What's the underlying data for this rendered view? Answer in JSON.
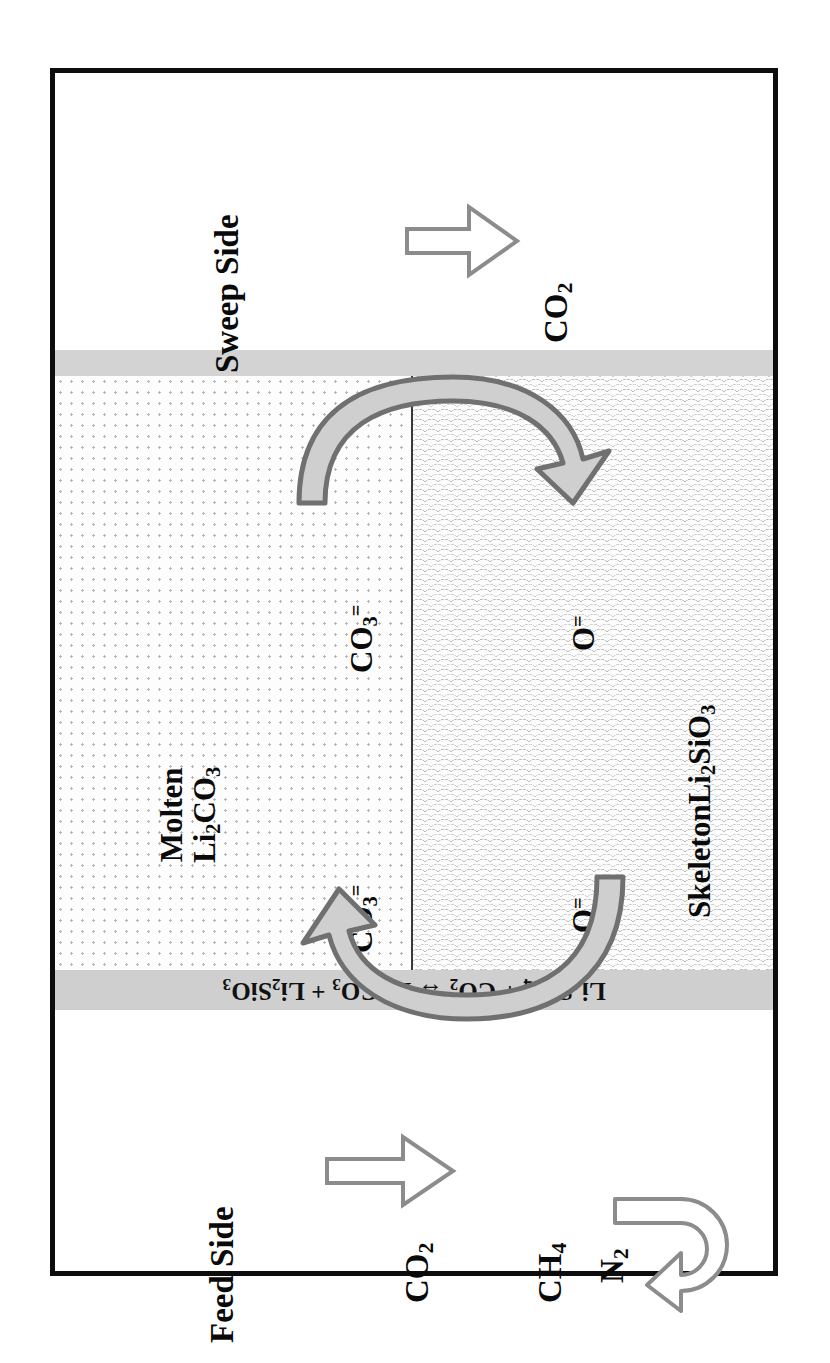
{
  "figure": {
    "type": "schematic-diagram",
    "orientation": "rotated-90-ccw"
  },
  "sweep_side": {
    "title": "Sweep Side",
    "gas_label": "CO",
    "gas_sub": "2",
    "arrow": "outward-permeate-arrow"
  },
  "feed_side": {
    "title": "Feed Side",
    "gas_label": "CO",
    "gas_sub": "2",
    "retentate": [
      {
        "label": "CH",
        "sub": "4"
      },
      {
        "label": "N",
        "sub": "2"
      }
    ],
    "arrow": "inward-feed-arrow",
    "uturn_arrow": "retentate-uturn-arrow"
  },
  "membrane": {
    "molten_phase": {
      "line1": "Molten",
      "line2_base": "Li",
      "line2": "Li2CO3"
    },
    "skeleton_phase": {
      "line1": "Skeleton",
      "line2": "Li2SiO3"
    },
    "ion_labels": {
      "carbonate": "CO3=",
      "oxide": "O="
    },
    "transport_arrows": [
      {
        "name": "carbonate-to-oxide",
        "direction": "left-to-right"
      },
      {
        "name": "oxide-to-carbonate",
        "direction": "right-to-left"
      }
    ]
  },
  "equation": {
    "text": "Li4SiO4 + CO2 ↔ Li2CO3 + Li2SiO3",
    "parts": [
      {
        "formula": "Li",
        "sub": "4"
      },
      {
        "formula": "SiO",
        "sub": "4"
      },
      {
        "op": " + "
      },
      {
        "formula": "CO",
        "sub": "2"
      },
      {
        "op": " ↔ "
      },
      {
        "formula": "Li",
        "sub": "2"
      },
      {
        "formula": "CO",
        "sub": "3"
      },
      {
        "op": " + "
      },
      {
        "formula": "Li",
        "sub": "2"
      },
      {
        "formula": "SiO",
        "sub": "3"
      }
    ]
  },
  "colors": {
    "frame": "#0d0d0d",
    "gray_band": "#d3d3d3",
    "equation_band": "#cfcfcf",
    "arrow_outline": "#8c8c8c",
    "curved_arrow_fill": "#c9c9c9",
    "curved_arrow_stroke": "#707070",
    "divider": "#3a3a3a"
  }
}
